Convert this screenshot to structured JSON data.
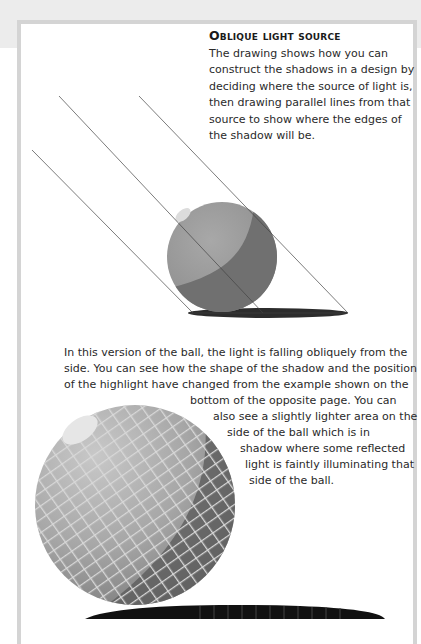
{
  "page": {
    "heading": "Oblique light source",
    "intro_lines": [
      "The drawing shows how you can",
      "construct the shadows in a design by",
      "deciding where the source of light is,",
      "then drawing parallel lines from that",
      "source to show where the edges of",
      "the shadow will be."
    ],
    "body_lines": [
      "In this version of the ball, the light is falling obliquely from the",
      "side. You can see how the shape of the shadow and the position",
      "of the highlight have changed from the example shown on the",
      "bottom of the opposite page. You can",
      "also see a slightly lighter area on the",
      "side of the ball which is in",
      "shadow where some reflected",
      "light is faintly illuminating that",
      "side of the ball."
    ]
  },
  "figures": {
    "diagram": "shaded-sphere-with-parallel-light-lines",
    "photo": "mosaic-ball-with-shadow"
  },
  "colors": {
    "frame_border": "#d4d4d4",
    "top_band": "#ececec",
    "sphere_light": "#9a9a9a",
    "sphere_dark": "#6e6e6e",
    "shadow": "#2c2c2c"
  }
}
